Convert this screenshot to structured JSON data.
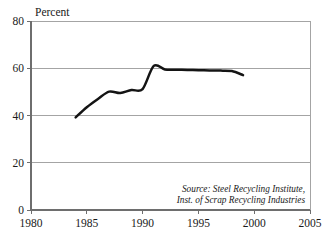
{
  "chart_data": {
    "type": "line",
    "title": "",
    "xlabel": "",
    "ylabel": "Percent",
    "ylim": [
      0,
      80
    ],
    "xlim": [
      1980,
      2005
    ],
    "yticks": [
      0,
      20,
      40,
      60,
      80
    ],
    "ytick_labels": [
      "0",
      "20",
      "40",
      "60",
      "80"
    ],
    "xticks": [
      1980,
      1985,
      1990,
      1995,
      2000,
      2005
    ],
    "xtick_labels": [
      "1980",
      "1985",
      "1990",
      "1995",
      "2000",
      "2005"
    ],
    "grid": true,
    "grid_axis": "y",
    "legend": false,
    "line_color": "#141414",
    "grid_color": "#9a9a9a",
    "series": [
      {
        "name": "Steel recycling rate",
        "x": [
          1984,
          1985,
          1986,
          1987,
          1988,
          1989,
          1990,
          1991,
          1992,
          1993,
          1994,
          1995,
          1996,
          1997,
          1998,
          1999
        ],
        "values": [
          39.2,
          43.5,
          47.0,
          50.1,
          49.5,
          50.8,
          51.2,
          61.0,
          59.5,
          59.4,
          59.3,
          59.2,
          59.1,
          59.0,
          58.8,
          57.1
        ]
      }
    ],
    "annotations": [
      "Source: Steel Recycling Institute,",
      "Inst. of Scrap Recycling Industries"
    ]
  },
  "axis": {
    "y_title": "Percent"
  },
  "source": {
    "line1": "Source: Steel Recycling Institute,",
    "line2": "Inst. of Scrap Recycling Industries"
  }
}
